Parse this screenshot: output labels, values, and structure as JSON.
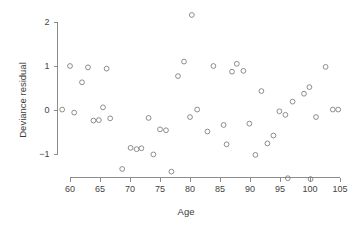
{
  "chart_data": {
    "type": "scatter",
    "title": "",
    "xlabel": "Age",
    "ylabel": "Deviance residual",
    "xlim": [
      58.2,
      105.6
    ],
    "ylim": [
      -1.78,
      2.32
    ],
    "grid": false,
    "legend": null,
    "xticks": [
      60,
      65,
      70,
      75,
      80,
      85,
      90,
      95,
      100,
      105
    ],
    "yticks": [
      2,
      1,
      0,
      -1
    ],
    "xtick_labels": [
      "60",
      "65",
      "70",
      "75",
      "80",
      "85",
      "90",
      "95",
      "100",
      "105"
    ],
    "ytick_labels": [
      "2",
      "1",
      "0",
      "−1"
    ],
    "marker": "open-circle",
    "marker_color": "#7a7a7a",
    "points": [
      {
        "x": 58.7,
        "y": 0.01
      },
      {
        "x": 60.0,
        "y": 1.0
      },
      {
        "x": 60.7,
        "y": -0.06
      },
      {
        "x": 62.0,
        "y": 0.63
      },
      {
        "x": 63.0,
        "y": 0.97
      },
      {
        "x": 63.9,
        "y": -0.24
      },
      {
        "x": 64.8,
        "y": -0.23
      },
      {
        "x": 65.5,
        "y": 0.06
      },
      {
        "x": 66.1,
        "y": 0.94
      },
      {
        "x": 66.7,
        "y": -0.19
      },
      {
        "x": 68.7,
        "y": -1.34
      },
      {
        "x": 70.1,
        "y": -0.86
      },
      {
        "x": 71.1,
        "y": -0.89
      },
      {
        "x": 71.9,
        "y": -0.87
      },
      {
        "x": 73.1,
        "y": -0.18
      },
      {
        "x": 73.9,
        "y": -1.01
      },
      {
        "x": 75.0,
        "y": -0.44
      },
      {
        "x": 76.0,
        "y": -0.46
      },
      {
        "x": 76.9,
        "y": -1.4
      },
      {
        "x": 78.0,
        "y": 0.77
      },
      {
        "x": 79.0,
        "y": 1.1
      },
      {
        "x": 80.0,
        "y": -0.16
      },
      {
        "x": 80.3,
        "y": 2.16
      },
      {
        "x": 81.2,
        "y": 0.01
      },
      {
        "x": 82.9,
        "y": -0.49
      },
      {
        "x": 83.9,
        "y": 1.0
      },
      {
        "x": 85.6,
        "y": -0.34
      },
      {
        "x": 86.1,
        "y": -0.78
      },
      {
        "x": 87.0,
        "y": 0.87
      },
      {
        "x": 87.8,
        "y": 1.05
      },
      {
        "x": 88.9,
        "y": 0.89
      },
      {
        "x": 89.9,
        "y": -0.31
      },
      {
        "x": 90.9,
        "y": -1.02
      },
      {
        "x": 91.9,
        "y": 0.43
      },
      {
        "x": 92.9,
        "y": -0.76
      },
      {
        "x": 93.9,
        "y": -0.58
      },
      {
        "x": 94.9,
        "y": -0.03
      },
      {
        "x": 95.9,
        "y": -0.11
      },
      {
        "x": 96.3,
        "y": -1.55
      },
      {
        "x": 97.1,
        "y": 0.19
      },
      {
        "x": 99.0,
        "y": 0.37
      },
      {
        "x": 99.9,
        "y": 0.52
      },
      {
        "x": 100.1,
        "y": -1.57
      },
      {
        "x": 101.0,
        "y": -0.16
      },
      {
        "x": 102.6,
        "y": 0.98
      },
      {
        "x": 103.8,
        "y": 0.01
      },
      {
        "x": 104.7,
        "y": 0.01
      }
    ],
    "n_points": 47
  },
  "axes": {
    "x_axis_name": "age-axis",
    "y_axis_name": "deviance-residual-axis"
  }
}
